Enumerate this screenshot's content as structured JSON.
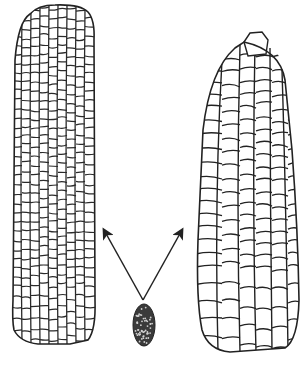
{
  "figure": {
    "colors": {
      "line": "#222222",
      "background": "#ffffff",
      "small_cob_fill": "#3a3a3a"
    },
    "elements": {
      "left_cob": {
        "label": "",
        "shape": "long slender cob with many small kernels"
      },
      "right_cob": {
        "label": "",
        "shape": "tapered cob with large flattened kernels"
      },
      "small_cob": {
        "label": "",
        "shape": "tiny dark ancestral cob"
      },
      "arrows": [
        {
          "from": [
            143,
            300
          ],
          "to": [
            103,
            228
          ]
        },
        {
          "from": [
            143,
            300
          ],
          "to": [
            183,
            228
          ]
        }
      ]
    }
  }
}
